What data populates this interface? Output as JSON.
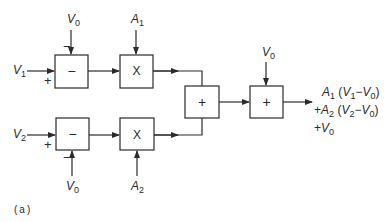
{
  "diagram": {
    "blocks": [
      {
        "id": "sub1",
        "op": "−",
        "type": "subtractor"
      },
      {
        "id": "mul1",
        "op": "X",
        "type": "multiplier"
      },
      {
        "id": "sub2",
        "op": "−",
        "type": "subtractor"
      },
      {
        "id": "mul2",
        "op": "X",
        "type": "multiplier"
      },
      {
        "id": "sum1",
        "op": "+",
        "type": "adder"
      },
      {
        "id": "sum2",
        "op": "+",
        "type": "adder"
      }
    ],
    "inputs": {
      "v1": {
        "base": "V",
        "sub": "1"
      },
      "v2": {
        "base": "V",
        "sub": "2"
      },
      "v0_top": {
        "base": "V",
        "sub": "0"
      },
      "v0_bottom": {
        "base": "V",
        "sub": "0"
      },
      "v0_sum": {
        "base": "V",
        "sub": "0"
      },
      "a1": {
        "base": "A",
        "sub": "1"
      },
      "a2": {
        "base": "A",
        "sub": "2"
      }
    },
    "signs": {
      "sub1_plus": "+",
      "sub1_minus": "−",
      "sub2_plus": "+",
      "sub2_minus": "−"
    },
    "output": {
      "line1": {
        "a": "A",
        "a_sub": "1",
        "open": " (",
        "v": "V",
        "v_sub": "1",
        "minus": "−",
        "v0": "V",
        "v0_sub": "0",
        "close": ")"
      },
      "line2": {
        "prefix": "+",
        "a": "A",
        "a_sub": "2",
        "open": " (",
        "v": "V",
        "v_sub": "2",
        "minus": "−",
        "v0": "V",
        "v0_sub": "0",
        "close": ")"
      },
      "line3": {
        "prefix": "+",
        "v0": "V",
        "v0_sub": "0"
      }
    },
    "caption": "(a)"
  }
}
